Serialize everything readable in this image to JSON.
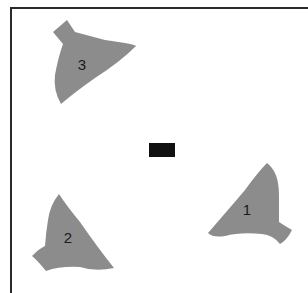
{
  "diagram": {
    "type": "spatial-arrangement",
    "background": "#ffffff",
    "shape_color": "#8c8c8c",
    "center_marker_color": "#111111",
    "shapes": [
      {
        "id": 1,
        "label": "1"
      },
      {
        "id": 2,
        "label": "2"
      },
      {
        "id": 3,
        "label": "3"
      }
    ]
  }
}
